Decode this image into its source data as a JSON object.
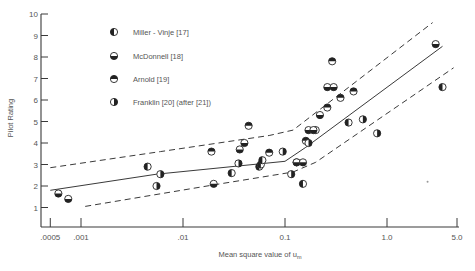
{
  "chart_data": {
    "type": "scatter",
    "title": "",
    "xlabel": "Mean square value of u_m",
    "xlabel_main": "Mean square value of u",
    "xlabel_sub": "m",
    "ylabel": "Pilot Rating",
    "xscale": "log",
    "xlim": [
      0.0005,
      5.0
    ],
    "ylim": [
      0,
      10
    ],
    "x_ticks": [
      0.0005,
      0.001,
      0.01,
      0.1,
      1.0,
      5.0
    ],
    "x_tick_labels": [
      ".0005",
      ".001",
      ".01",
      "0.1",
      "1.0",
      "5.0"
    ],
    "y_ticks": [
      1,
      2,
      3,
      4,
      5,
      6,
      7,
      8,
      9,
      10
    ],
    "y_tick_labels": [
      "1",
      "2",
      "3",
      "4",
      "5",
      "6",
      "7",
      "8",
      "9",
      "10"
    ],
    "grid": false,
    "legend_position": "upper-left",
    "legend": [
      {
        "name": "Miller - Vinje [17]",
        "marker": "half-left"
      },
      {
        "name": "McDonnell [18]",
        "marker": "half-bottom"
      },
      {
        "name": "Arnold [19]",
        "marker": "half-top"
      },
      {
        "name": "Franklin [20] (after [21])",
        "marker": "half-right"
      }
    ],
    "fit_lines": [
      {
        "name": "mean",
        "style": "solid",
        "points": [
          [
            0.0005,
            1.8
          ],
          [
            0.0055,
            2.55
          ],
          [
            0.1,
            3.15
          ],
          [
            0.16,
            3.8
          ],
          [
            3.5,
            8.5
          ]
        ]
      },
      {
        "name": "upper-bound",
        "style": "dashed",
        "points": [
          [
            0.0005,
            2.85
          ],
          [
            0.006,
            3.6
          ],
          [
            0.07,
            4.35
          ],
          [
            0.12,
            4.6
          ],
          [
            2.8,
            9.6
          ]
        ]
      },
      {
        "name": "lower-bound",
        "style": "dashed",
        "points": [
          [
            0.0011,
            1.05
          ],
          [
            0.02,
            2.05
          ],
          [
            0.12,
            2.65
          ],
          [
            0.2,
            3.1
          ],
          [
            4.5,
            7.5
          ]
        ]
      }
    ],
    "series": [
      {
        "name": "Miller - Vinje [17]",
        "marker": "half-left",
        "points": [
          [
            0.0045,
            2.9
          ],
          [
            0.03,
            2.6
          ],
          [
            0.056,
            2.9
          ],
          [
            0.058,
            3.0
          ],
          [
            0.13,
            3.1
          ],
          [
            0.15,
            2.1
          ],
          [
            0.06,
            3.2
          ],
          [
            0.42,
            4.95
          ],
          [
            0.2,
            4.6
          ],
          [
            3.5,
            6.6
          ]
        ]
      },
      {
        "name": "McDonnell [18]",
        "marker": "half-bottom",
        "points": [
          [
            0.0006,
            1.65
          ],
          [
            0.00075,
            1.4
          ],
          [
            0.02,
            2.1
          ],
          [
            0.036,
            3.7
          ],
          [
            0.04,
            4.0
          ],
          [
            0.13,
            3.1
          ],
          [
            0.15,
            3.1
          ],
          [
            0.17,
            4.6
          ],
          [
            0.19,
            4.6
          ],
          [
            0.22,
            5.3
          ],
          [
            0.26,
            6.6
          ],
          [
            0.3,
            6.6
          ],
          [
            3.0,
            8.6
          ]
        ]
      },
      {
        "name": "Arnold [19]",
        "marker": "half-top",
        "points": [
          [
            0.019,
            3.6
          ],
          [
            0.044,
            4.8
          ],
          [
            0.29,
            7.8
          ],
          [
            0.35,
            6.1
          ],
          [
            0.47,
            6.4
          ],
          [
            0.26,
            5.65
          ],
          [
            0.07,
            3.55
          ],
          [
            0.16,
            4.1
          ]
        ]
      },
      {
        "name": "Franklin [20] (after [21])",
        "marker": "half-right",
        "points": [
          [
            0.0055,
            2.0
          ],
          [
            0.006,
            2.55
          ],
          [
            0.035,
            3.05
          ],
          [
            0.095,
            3.6
          ],
          [
            0.115,
            2.55
          ],
          [
            0.17,
            4.0
          ],
          [
            0.58,
            5.1
          ],
          [
            0.8,
            4.45
          ]
        ]
      }
    ]
  }
}
